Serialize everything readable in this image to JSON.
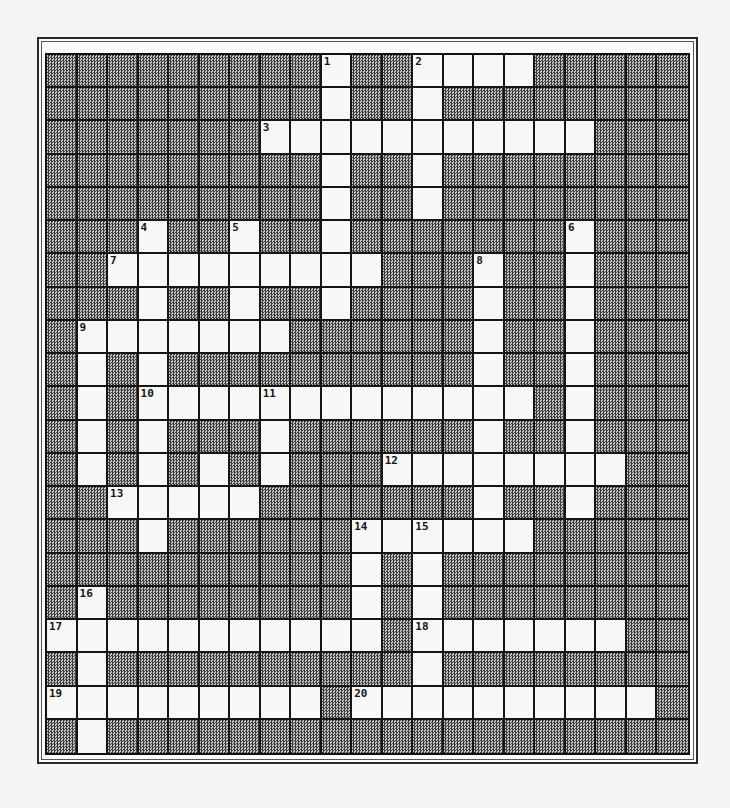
{
  "puzzle": {
    "rows": 21,
    "cols": 21,
    "colors": {
      "open_cell": "#f7f7f5",
      "blocked_cell": "#9a9a9a",
      "grid_line": "#151515",
      "frame": "#2a2a2a"
    },
    "open_cells": {
      "0": [
        9,
        12,
        13,
        14,
        15
      ],
      "1": [
        9,
        12
      ],
      "2": [
        7,
        8,
        9,
        10,
        11,
        12,
        13,
        14,
        15,
        16,
        17
      ],
      "3": [
        9,
        12
      ],
      "4": [
        9,
        12
      ],
      "5": [
        3,
        6,
        9,
        17
      ],
      "6": [
        2,
        3,
        4,
        5,
        6,
        7,
        8,
        9,
        10,
        14,
        17
      ],
      "7": [
        3,
        6,
        9,
        14,
        17
      ],
      "8": [
        1,
        2,
        3,
        4,
        5,
        6,
        7,
        14,
        17
      ],
      "9": [
        1,
        3,
        14,
        17
      ],
      "10": [
        1,
        3,
        4,
        5,
        6,
        7,
        8,
        9,
        10,
        11,
        12,
        13,
        14,
        15,
        17
      ],
      "11": [
        1,
        3,
        7,
        14,
        17
      ],
      "12": [
        1,
        3,
        5,
        7,
        11,
        12,
        13,
        14,
        15,
        16,
        17,
        18
      ],
      "13": [
        2,
        3,
        4,
        5,
        6,
        14,
        17
      ],
      "14": [
        3,
        10,
        11,
        12,
        13,
        14,
        15
      ],
      "15": [
        10,
        12
      ],
      "16": [
        1,
        10,
        12
      ],
      "17": [
        0,
        1,
        2,
        3,
        4,
        5,
        6,
        7,
        8,
        9,
        10,
        12,
        13,
        14,
        15,
        16,
        17,
        18
      ],
      "18": [
        1,
        12
      ],
      "19": [
        0,
        1,
        2,
        3,
        4,
        5,
        6,
        7,
        8,
        10,
        11,
        12,
        13,
        14,
        15,
        16,
        17,
        18,
        19
      ],
      "20": [
        1
      ]
    },
    "numbers": [
      {
        "label": "1",
        "row": 0,
        "col": 9
      },
      {
        "label": "2",
        "row": 0,
        "col": 12
      },
      {
        "label": "3",
        "row": 2,
        "col": 7
      },
      {
        "label": "4",
        "row": 5,
        "col": 3
      },
      {
        "label": "5",
        "row": 5,
        "col": 6
      },
      {
        "label": "6",
        "row": 5,
        "col": 17
      },
      {
        "label": "7",
        "row": 6,
        "col": 2
      },
      {
        "label": "8",
        "row": 6,
        "col": 14
      },
      {
        "label": "9",
        "row": 8,
        "col": 1
      },
      {
        "label": "10",
        "row": 10,
        "col": 3
      },
      {
        "label": "11",
        "row": 10,
        "col": 7
      },
      {
        "label": "12",
        "row": 12,
        "col": 11
      },
      {
        "label": "13",
        "row": 13,
        "col": 2
      },
      {
        "label": "14",
        "row": 14,
        "col": 10
      },
      {
        "label": "15",
        "row": 14,
        "col": 12
      },
      {
        "label": "16",
        "row": 16,
        "col": 1
      },
      {
        "label": "17",
        "row": 17,
        "col": 0
      },
      {
        "label": "18",
        "row": 17,
        "col": 12
      },
      {
        "label": "19",
        "row": 19,
        "col": 0
      },
      {
        "label": "20",
        "row": 19,
        "col": 10
      }
    ],
    "entries": {
      "across": [
        {
          "number": "2",
          "row": 0,
          "col": 12,
          "length": 4
        },
        {
          "number": "3",
          "row": 2,
          "col": 7,
          "length": 11
        },
        {
          "number": "7",
          "row": 6,
          "col": 2,
          "length": 9
        },
        {
          "number": "9",
          "row": 8,
          "col": 1,
          "length": 7
        },
        {
          "number": "10",
          "row": 10,
          "col": 3,
          "length": 13
        },
        {
          "number": "12",
          "row": 12,
          "col": 11,
          "length": 8
        },
        {
          "number": "13",
          "row": 13,
          "col": 2,
          "length": 5
        },
        {
          "number": "14",
          "row": 14,
          "col": 10,
          "length": 6
        },
        {
          "number": "17",
          "row": 17,
          "col": 0,
          "length": 11
        },
        {
          "number": "18",
          "row": 17,
          "col": 12,
          "length": 7
        },
        {
          "number": "19",
          "row": 19,
          "col": 0,
          "length": 9
        },
        {
          "number": "20",
          "row": 19,
          "col": 10,
          "length": 10
        }
      ],
      "down": [
        {
          "number": "1",
          "row": 0,
          "col": 9,
          "length": 8
        },
        {
          "number": "2",
          "row": 0,
          "col": 12,
          "length": 5
        },
        {
          "number": "4",
          "row": 5,
          "col": 3,
          "length": 10
        },
        {
          "number": "5",
          "row": 5,
          "col": 6,
          "length": 4
        },
        {
          "number": "6",
          "row": 5,
          "col": 17,
          "length": 9
        },
        {
          "number": "8",
          "row": 6,
          "col": 14,
          "length": 9
        },
        {
          "number": "9",
          "row": 8,
          "col": 1,
          "length": 5
        },
        {
          "number": "11",
          "row": 10,
          "col": 7,
          "length": 3
        },
        {
          "number": "14",
          "row": 14,
          "col": 10,
          "length": 4
        },
        {
          "number": "15",
          "row": 14,
          "col": 12,
          "length": 6
        },
        {
          "number": "16",
          "row": 16,
          "col": 1,
          "length": 5
        }
      ]
    }
  }
}
